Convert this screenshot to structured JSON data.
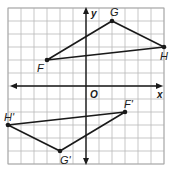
{
  "diagram": {
    "type": "coordinate-plane-rotation",
    "grid": {
      "xmin": -6,
      "xmax": 6,
      "ymin": -6,
      "ymax": 6,
      "step": 1
    },
    "axes": {
      "x_label": "x",
      "y_label": "y",
      "origin_label": "O"
    },
    "colors": {
      "grid": "#b9b9b9",
      "ink": "#1a1a1a",
      "background": "#ffffff"
    },
    "preimage": {
      "name": "triangle FGH",
      "vertices": [
        {
          "label": "F",
          "x": -3,
          "y": 2
        },
        {
          "label": "G",
          "x": 2,
          "y": 5
        },
        {
          "label": "H",
          "x": 6,
          "y": 3
        }
      ]
    },
    "image": {
      "name": "triangle F'G'H'",
      "vertices": [
        {
          "label": "F'",
          "x": 3,
          "y": -2
        },
        {
          "label": "G'",
          "x": -2,
          "y": -5
        },
        {
          "label": "H'",
          "x": -6,
          "y": -3
        }
      ]
    }
  }
}
